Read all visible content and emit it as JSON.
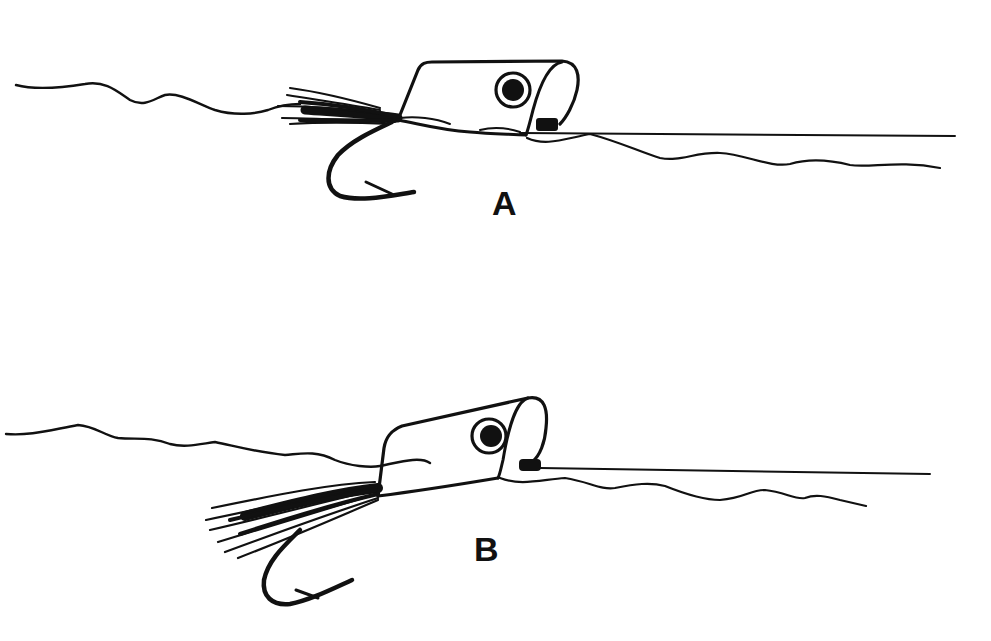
{
  "figure": {
    "type": "line-drawing",
    "ink_color": "#111111",
    "background_color": "#ffffff",
    "panels": [
      {
        "id": "A",
        "label": "A",
        "description": "popper body floats level, hook and tail hang below surface"
      },
      {
        "id": "B",
        "label": "B",
        "description": "popper nose tilted up, tail and hook submerged lower"
      }
    ]
  }
}
